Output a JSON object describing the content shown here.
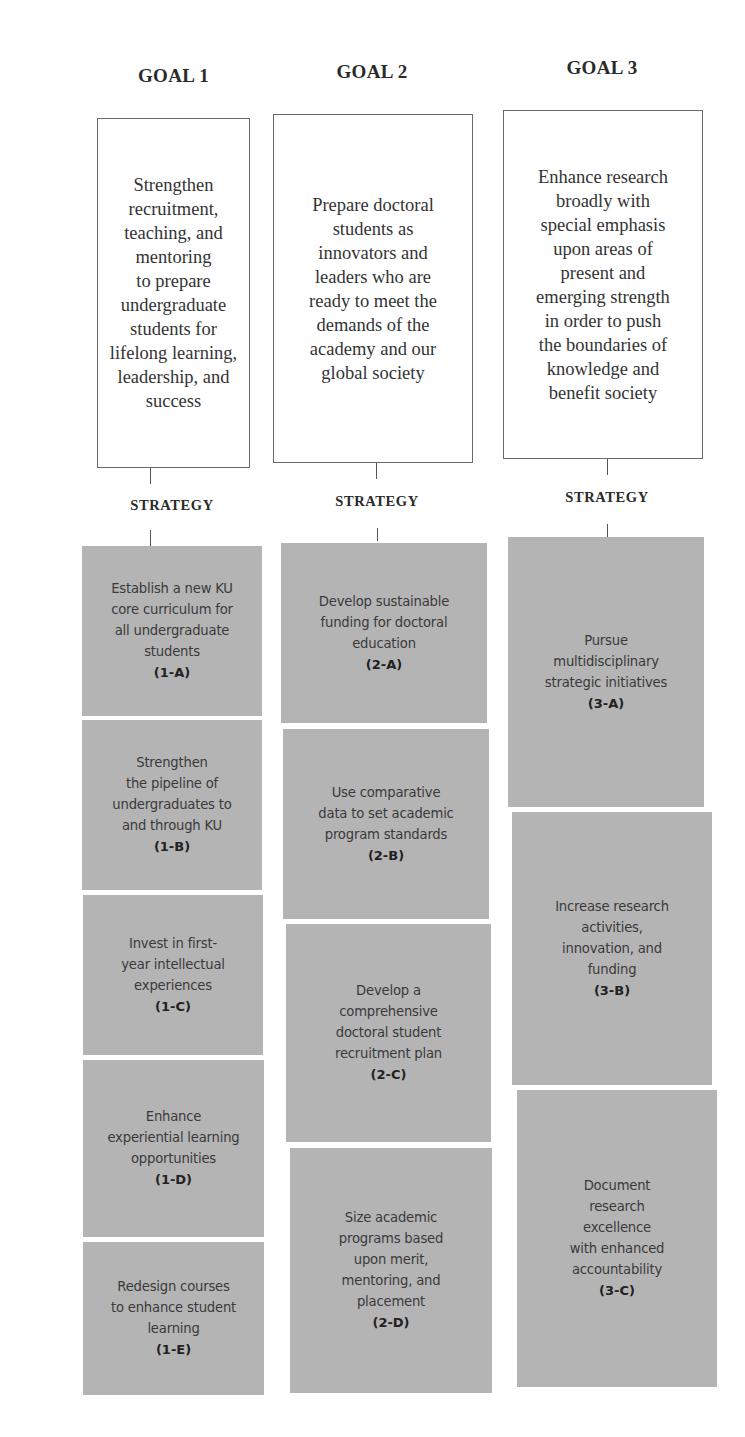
{
  "goals": [
    {
      "title": "GOAL 1",
      "description": "Strengthen\nrecruitment,\nteaching, and\nmentoring\nto prepare\nundergraduate\nstudents for\nlifelong learning,\nleadership, and\nsuccess",
      "strategy_label": "STRATEGY",
      "strategies": [
        {
          "text": "Establish a new KU\ncore curriculum for\nall undergraduate\nstudents",
          "code": "(1-A)"
        },
        {
          "text": "Strengthen\nthe pipeline of\nundergraduates to\nand through KU",
          "code": "(1-B)"
        },
        {
          "text": "Invest in first-\nyear intellectual\nexperiences",
          "code": "(1-C)"
        },
        {
          "text": "Enhance\nexperiential learning\nopportunities",
          "code": "(1-D)"
        },
        {
          "text": "Redesign courses\nto enhance student\nlearning",
          "code": "(1-E)"
        }
      ]
    },
    {
      "title": "GOAL 2",
      "description": "Prepare doctoral\nstudents as\ninnovators and\nleaders who are\nready to meet the\ndemands of the\nacademy and our\nglobal society",
      "strategy_label": "STRATEGY",
      "strategies": [
        {
          "text": "Develop sustainable\nfunding for doctoral\neducation",
          "code": "(2-A)"
        },
        {
          "text": "Use comparative\ndata to set academic\nprogram standards",
          "code": "(2-B)"
        },
        {
          "text": "Develop a\ncomprehensive\ndoctoral student\nrecruitment plan",
          "code": "(2-C)"
        },
        {
          "text": "Size academic\nprograms based\nupon merit,\nmentoring, and\nplacement",
          "code": "(2-D)"
        }
      ]
    },
    {
      "title": "GOAL 3",
      "description": "Enhance research\nbroadly with\nspecial emphasis\nupon areas of\npresent and\nemerging strength\nin order to push\nthe boundaries of\nknowledge and\nbenefit society",
      "strategy_label": "STRATEGY",
      "strategies": [
        {
          "text": "Pursue\nmultidisciplinary\nstrategic initiatives",
          "code": "(3-A)"
        },
        {
          "text": "Increase research\nactivities,\ninnovation, and\nfunding",
          "code": "(3-B)"
        },
        {
          "text": "Document\nresearch\nexcellence\nwith enhanced\naccountability",
          "code": "(3-C)"
        }
      ]
    }
  ],
  "colors": {
    "strategy_fill": "#b4b4b4",
    "goal_border": "#6a6a6a",
    "background": "#ffffff"
  }
}
